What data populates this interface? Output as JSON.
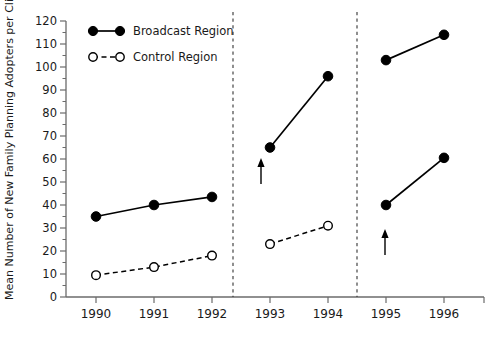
{
  "chart_data": {
    "type": "line",
    "title": "",
    "xlabel": "",
    "ylabel": "Mean Number of New Family Planning Adopters per Clinic",
    "categories": [
      "1990",
      "1991",
      "1992",
      "1993",
      "1994",
      "1995",
      "1996"
    ],
    "ylim": [
      0,
      120
    ],
    "yticks": [
      0,
      10,
      20,
      30,
      40,
      50,
      60,
      70,
      80,
      90,
      100,
      110,
      120
    ],
    "ytick_labels": [
      "0",
      "10",
      "20",
      "30",
      "40",
      "50",
      "60",
      "70",
      "80",
      "90",
      "100",
      "110",
      "120"
    ],
    "grid": false,
    "legend_position": "top-left",
    "panels": [
      {
        "name": "panel-1990-1992",
        "categories": [
          "1990",
          "1991",
          "1992"
        ],
        "series": [
          {
            "name": "Broadcast Region",
            "values": [
              35,
              40,
              43.5
            ],
            "marker": "filled",
            "line": "solid"
          },
          {
            "name": "Control Region",
            "values": [
              9.5,
              13,
              18
            ],
            "marker": "open",
            "line": "dashed"
          }
        ]
      },
      {
        "name": "panel-1993-1994",
        "categories": [
          "1993",
          "1994"
        ],
        "series": [
          {
            "name": "Broadcast Region",
            "values": [
              65,
              96
            ],
            "marker": "filled",
            "line": "solid"
          },
          {
            "name": "Control Region",
            "values": [
              23,
              31
            ],
            "marker": "open",
            "line": "dashed"
          }
        ]
      },
      {
        "name": "panel-1995-1996",
        "categories": [
          "1995",
          "1996"
        ],
        "series": [
          {
            "name": "Broadcast Region",
            "values": [
              103,
              114
            ],
            "marker": "filled",
            "line": "solid"
          },
          {
            "name": "Control Region",
            "values": [
              40,
              60.5
            ],
            "marker": "filled",
            "line": "solid"
          }
        ]
      }
    ],
    "series": [
      {
        "name": "Broadcast Region",
        "values": [
          35,
          40,
          43.5,
          65,
          96,
          103,
          114
        ]
      },
      {
        "name": "Control Region",
        "values": [
          9.5,
          13,
          18,
          23,
          31,
          40,
          60.5
        ]
      }
    ],
    "annotations": [
      {
        "type": "arrow",
        "label": "",
        "points_to_year": "1993",
        "points_to_series": "Broadcast Region",
        "points_to_value": 65
      },
      {
        "type": "arrow",
        "label": "",
        "points_to_year": "1995",
        "points_to_series": "Control Region",
        "points_to_value": 40
      }
    ],
    "dividers": [
      {
        "between": [
          "1992",
          "1993"
        ]
      },
      {
        "between": [
          "1994",
          "1995"
        ]
      }
    ]
  },
  "legend": {
    "items": [
      {
        "label": "Broadcast Region",
        "marker": "filled-circle",
        "line": "solid"
      },
      {
        "label": "Control Region",
        "marker": "open-circle",
        "line": "dashed"
      }
    ]
  }
}
